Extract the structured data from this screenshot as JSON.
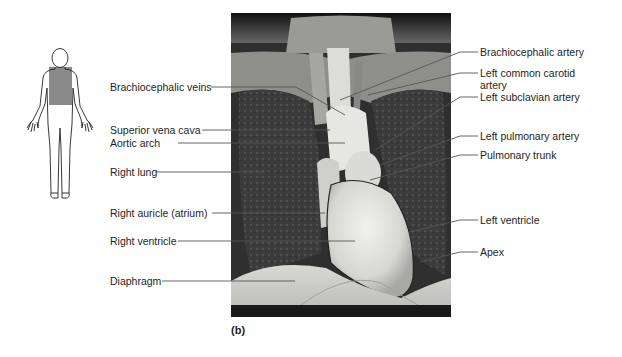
{
  "figure": {
    "panel_label": "(b)",
    "orientation_icon": "human-body-outline-with-thorax-highlighted",
    "highlight_color": "#8a8a8a",
    "left_labels": [
      {
        "id": "brachiocephalic-veins",
        "text": "Brachiocephalic veins"
      },
      {
        "id": "superior-vena-cava",
        "text": "Superior vena cava"
      },
      {
        "id": "aortic-arch",
        "text": "Aortic arch"
      },
      {
        "id": "right-lung",
        "text": "Right lung"
      },
      {
        "id": "right-auricle",
        "text": "Right auricle (atrium)"
      },
      {
        "id": "right-ventricle",
        "text": "Right ventricle"
      },
      {
        "id": "diaphragm",
        "text": "Diaphragm"
      }
    ],
    "right_labels": [
      {
        "id": "brachiocephalic-artery",
        "text": "Brachiocephalic artery"
      },
      {
        "id": "left-common-carotid-artery",
        "text": "Left common carotid",
        "text2": "artery"
      },
      {
        "id": "left-subclavian-artery",
        "text": "Left subclavian artery"
      },
      {
        "id": "left-pulmonary-artery",
        "text": "Left pulmonary artery"
      },
      {
        "id": "pulmonary-trunk",
        "text": "Pulmonary trunk"
      },
      {
        "id": "left-ventricle",
        "text": "Left ventricle"
      },
      {
        "id": "apex",
        "text": "Apex"
      }
    ]
  }
}
